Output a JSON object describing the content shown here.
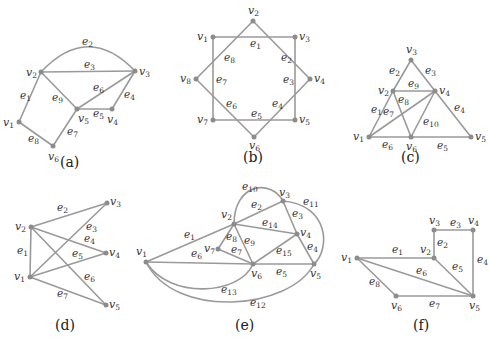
{
  "figure": {
    "colors": {
      "edge": "#9a9a9a",
      "vertex": "#8c8c8c",
      "text": "#333333",
      "background": "#ffffff"
    },
    "graphs": [
      {
        "id": "a",
        "caption": "(a)",
        "vertices": [
          {
            "name": "v1",
            "x": 19,
            "y": 122
          },
          {
            "name": "v2",
            "x": 41,
            "y": 72
          },
          {
            "name": "v3",
            "x": 135,
            "y": 71
          },
          {
            "name": "v4",
            "x": 112,
            "y": 109
          },
          {
            "name": "v5",
            "x": 77,
            "y": 109
          },
          {
            "name": "v6",
            "x": 53,
            "y": 146
          }
        ],
        "edges": [
          {
            "name": "e1",
            "from": "v1",
            "to": "v2"
          },
          {
            "name": "e2",
            "from": "v2",
            "to": "v3",
            "curved": true
          },
          {
            "name": "e3",
            "from": "v2",
            "to": "v3"
          },
          {
            "name": "e4",
            "from": "v3",
            "to": "v4"
          },
          {
            "name": "e5",
            "from": "v5",
            "to": "v4"
          },
          {
            "name": "e6",
            "from": "v5",
            "to": "v3"
          },
          {
            "name": "e7",
            "from": "v6",
            "to": "v5"
          },
          {
            "name": "e8",
            "from": "v1",
            "to": "v6"
          },
          {
            "name": "e9",
            "from": "v2",
            "to": "v5"
          }
        ]
      },
      {
        "id": "b",
        "caption": "(b)",
        "vertices": [
          {
            "name": "v1",
            "x": 213,
            "y": 37
          },
          {
            "name": "v2",
            "x": 253,
            "y": 21
          },
          {
            "name": "v3",
            "x": 295,
            "y": 37
          },
          {
            "name": "v4",
            "x": 310,
            "y": 79
          },
          {
            "name": "v5",
            "x": 295,
            "y": 120
          },
          {
            "name": "v6",
            "x": 254,
            "y": 137
          },
          {
            "name": "v7",
            "x": 213,
            "y": 120
          },
          {
            "name": "v8",
            "x": 196,
            "y": 79
          }
        ],
        "edges": [
          {
            "name": "e1",
            "from": "v1",
            "to": "v3"
          },
          {
            "name": "e2",
            "from": "v2",
            "to": "v4"
          },
          {
            "name": "e3",
            "from": "v3",
            "to": "v5"
          },
          {
            "name": "e4",
            "from": "v4",
            "to": "v6"
          },
          {
            "name": "e5",
            "from": "v5",
            "to": "v7"
          },
          {
            "name": "e6",
            "from": "v6",
            "to": "v8"
          },
          {
            "name": "e7",
            "from": "v7",
            "to": "v1"
          },
          {
            "name": "e8",
            "from": "v8",
            "to": "v2"
          }
        ]
      },
      {
        "id": "c",
        "caption": "(c)",
        "vertices": [
          {
            "name": "v1",
            "x": 369,
            "y": 137
          },
          {
            "name": "v2",
            "x": 393,
            "y": 91
          },
          {
            "name": "v3",
            "x": 411,
            "y": 60
          },
          {
            "name": "v4",
            "x": 435,
            "y": 91
          },
          {
            "name": "v5",
            "x": 471,
            "y": 137
          },
          {
            "name": "v6",
            "x": 411,
            "y": 137
          }
        ],
        "edges": [
          {
            "name": "e1",
            "from": "v1",
            "to": "v2"
          },
          {
            "name": "e2",
            "from": "v2",
            "to": "v3"
          },
          {
            "name": "e3",
            "from": "v3",
            "to": "v4"
          },
          {
            "name": "e4",
            "from": "v4",
            "to": "v5"
          },
          {
            "name": "e5",
            "from": "v6",
            "to": "v5"
          },
          {
            "name": "e6",
            "from": "v1",
            "to": "v6"
          },
          {
            "name": "e7",
            "from": "v1",
            "to": "v4"
          },
          {
            "name": "e8",
            "from": "v2",
            "to": "v6"
          },
          {
            "name": "e9",
            "from": "v2",
            "to": "v4"
          },
          {
            "name": "e10",
            "from": "v6",
            "to": "v4"
          }
        ]
      },
      {
        "id": "d",
        "caption": "(d)",
        "vertices": [
          {
            "name": "v1",
            "x": 30,
            "y": 277
          },
          {
            "name": "v2",
            "x": 31,
            "y": 227
          },
          {
            "name": "v3",
            "x": 107,
            "y": 203
          },
          {
            "name": "v4",
            "x": 106,
            "y": 253
          },
          {
            "name": "v5",
            "x": 106,
            "y": 305
          }
        ],
        "edges": [
          {
            "name": "e1",
            "from": "v1",
            "to": "v2"
          },
          {
            "name": "e2",
            "from": "v2",
            "to": "v3"
          },
          {
            "name": "e3",
            "from": "v1",
            "to": "v3"
          },
          {
            "name": "e4",
            "from": "v2",
            "to": "v4"
          },
          {
            "name": "e5",
            "from": "v1",
            "to": "v4"
          },
          {
            "name": "e6",
            "from": "v2",
            "to": "v5"
          },
          {
            "name": "e7",
            "from": "v1",
            "to": "v5"
          }
        ]
      },
      {
        "id": "e",
        "caption": "(e)",
        "vertices": [
          {
            "name": "v1",
            "x": 146,
            "y": 262
          },
          {
            "name": "v2",
            "x": 234,
            "y": 224
          },
          {
            "name": "v3",
            "x": 283,
            "y": 201
          },
          {
            "name": "v4",
            "x": 297,
            "y": 234
          },
          {
            "name": "v5",
            "x": 314,
            "y": 264
          },
          {
            "name": "v6",
            "x": 253,
            "y": 264
          },
          {
            "name": "v7",
            "x": 218,
            "y": 249
          }
        ],
        "edges": [
          {
            "name": "e1",
            "from": "v1",
            "to": "v2"
          },
          {
            "name": "e2",
            "from": "v2",
            "to": "v3"
          },
          {
            "name": "e3",
            "from": "v3",
            "to": "v4"
          },
          {
            "name": "e4",
            "from": "v4",
            "to": "v5"
          },
          {
            "name": "e5",
            "from": "v6",
            "to": "v5"
          },
          {
            "name": "e6",
            "from": "v1",
            "to": "v6"
          },
          {
            "name": "e7",
            "from": "v7",
            "to": "v6"
          },
          {
            "name": "e8",
            "from": "v7",
            "to": "v2"
          },
          {
            "name": "e9",
            "from": "v2",
            "to": "v6"
          },
          {
            "name": "e10",
            "from": "v2",
            "to": "v3",
            "curved": true
          },
          {
            "name": "e11",
            "from": "v3",
            "to": "v5",
            "curved": true
          },
          {
            "name": "e12",
            "from": "v1",
            "to": "v5",
            "curved": true
          },
          {
            "name": "e13",
            "from": "v1",
            "to": "v6",
            "curved": true
          },
          {
            "name": "e14",
            "from": "v2",
            "to": "v4"
          },
          {
            "name": "e15",
            "from": "v6",
            "to": "v4"
          }
        ]
      },
      {
        "id": "f",
        "caption": "(f)",
        "vertices": [
          {
            "name": "v1",
            "x": 357,
            "y": 258
          },
          {
            "name": "v2",
            "x": 434,
            "y": 258
          },
          {
            "name": "v3",
            "x": 434,
            "y": 230
          },
          {
            "name": "v4",
            "x": 473,
            "y": 230
          },
          {
            "name": "v5",
            "x": 473,
            "y": 296
          },
          {
            "name": "v6",
            "x": 396,
            "y": 296
          }
        ],
        "edges": [
          {
            "name": "e1",
            "from": "v1",
            "to": "v2"
          },
          {
            "name": "e2",
            "from": "v2",
            "to": "v3"
          },
          {
            "name": "e3",
            "from": "v3",
            "to": "v4"
          },
          {
            "name": "e4",
            "from": "v4",
            "to": "v5"
          },
          {
            "name": "e5",
            "from": "v2",
            "to": "v5"
          },
          {
            "name": "e6",
            "from": "v1",
            "to": "v5"
          },
          {
            "name": "e7",
            "from": "v6",
            "to": "v5"
          },
          {
            "name": "e8",
            "from": "v1",
            "to": "v6"
          }
        ]
      }
    ]
  },
  "labels": {
    "a": {
      "caption": "(a)",
      "v": {
        "v1": "1",
        "v2": "2",
        "v3": "3",
        "v4": "4",
        "v5": "5",
        "v6": "6"
      },
      "e": {
        "e1": "1",
        "e2": "2",
        "e3": "3",
        "e4": "4",
        "e5": "5",
        "e6": "6",
        "e7": "7",
        "e8": "8",
        "e9": "9"
      }
    },
    "b": {
      "caption": "(b)",
      "v": {
        "v1": "1",
        "v2": "2",
        "v3": "3",
        "v4": "4",
        "v5": "5",
        "v6": "6",
        "v7": "7",
        "v8": "8"
      },
      "e": {
        "e1": "1",
        "e2": "2",
        "e3": "3",
        "e4": "4",
        "e5": "5",
        "e6": "6",
        "e7": "7",
        "e8": "8"
      }
    },
    "c": {
      "caption": "(c)",
      "v": {
        "v1": "1",
        "v2": "2",
        "v3": "3",
        "v4": "4",
        "v5": "5",
        "v6": "6"
      },
      "e": {
        "e1": "1",
        "e2": "2",
        "e3": "3",
        "e4": "4",
        "e5": "5",
        "e6": "6",
        "e7": "7",
        "e8": "8",
        "e9": "9",
        "e10": "10"
      }
    },
    "d": {
      "caption": "(d)",
      "v": {
        "v1": "1",
        "v2": "2",
        "v3": "3",
        "v4": "4",
        "v5": "5"
      },
      "e": {
        "e1": "1",
        "e2": "2",
        "e3": "3",
        "e4": "4",
        "e5": "5",
        "e6": "6",
        "e7": "7"
      }
    },
    "e": {
      "caption": "(e)",
      "v": {
        "v1": "1",
        "v2": "2",
        "v3": "3",
        "v4": "4",
        "v5": "5",
        "v6": "6",
        "v7": "7"
      },
      "e": {
        "e1": "1",
        "e2": "2",
        "e3": "3",
        "e4": "4",
        "e5": "5",
        "e6": "6",
        "e7": "7",
        "e8": "8",
        "e9": "9",
        "e10": "10",
        "e11": "11",
        "e12": "12",
        "e13": "13",
        "e14": "14",
        "e15": "15"
      }
    },
    "f": {
      "caption": "(f)",
      "v": {
        "v1": "1",
        "v2": "2",
        "v3": "3",
        "v4": "4",
        "v5": "5",
        "v6": "6"
      },
      "e": {
        "e1": "1",
        "e2": "2",
        "e3": "3",
        "e4": "4",
        "e5": "5",
        "e6": "6",
        "e7": "7",
        "e8": "8"
      }
    }
  }
}
